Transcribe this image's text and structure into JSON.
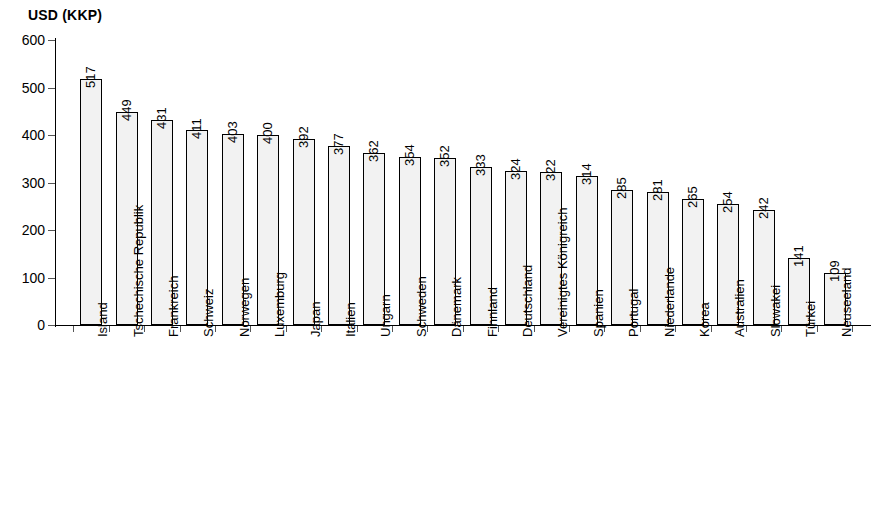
{
  "chart_data": {
    "type": "bar",
    "title": "USD (KKP)",
    "xlabel": "",
    "ylabel": "USD (KKP)",
    "ylim": [
      0,
      600
    ],
    "ytick_labels": [
      "0",
      "100",
      "200",
      "300",
      "400",
      "500",
      "600"
    ],
    "ytick_values": [
      0,
      100,
      200,
      300,
      400,
      500,
      600
    ],
    "grid": false,
    "legend": false,
    "legend_position": "none",
    "bar_fill_color": "#f2f2f2",
    "bar_border_color": "#000000",
    "axis_color": "#000000",
    "categories": [
      "Island",
      "Tschechische Republik",
      "Frankreich",
      "Schweiz",
      "Norwegen",
      "Luxemburg",
      "Japan",
      "Italien",
      "Ungarn",
      "Schweden",
      "Dänemark",
      "Finnland",
      "Deutschland",
      "Vereinigtes Königreich",
      "Spanien",
      "Portugal",
      "Niederlande",
      "Korea",
      "Australien",
      "Slowakei",
      "Türkei",
      "Neuseeland"
    ],
    "values": [
      517,
      449,
      431,
      411,
      403,
      400,
      392,
      377,
      362,
      354,
      352,
      333,
      324,
      322,
      314,
      285,
      281,
      265,
      254,
      242,
      141,
      109
    ],
    "data_labels": [
      "517",
      "449",
      "431",
      "411",
      "403",
      "400",
      "392",
      "377",
      "362",
      "354",
      "352",
      "333",
      "324",
      "322",
      "314",
      "285",
      "281",
      "265",
      "254",
      "242",
      "141",
      "109"
    ]
  }
}
